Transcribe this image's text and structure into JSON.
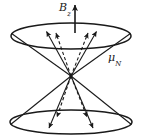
{
  "figure": {
    "type": "double-cone-precession-diagram",
    "background_color": "#ffffff",
    "stroke_color": "#1a1a1a",
    "labels": {
      "field": {
        "symbol": "B",
        "subscript": "z",
        "full": "Bz"
      },
      "moment": {
        "symbol": "μ",
        "subscript": "N",
        "full": "μN"
      }
    },
    "geometry": {
      "apex": {
        "x": 71,
        "y": 76
      },
      "top_ellipse": {
        "cx": 71,
        "cy": 36,
        "rx": 60,
        "ry": 13
      },
      "bottom_ellipse": {
        "cx": 71,
        "cy": 122,
        "rx": 61,
        "ry": 12
      },
      "field_arrow": {
        "x": 75,
        "y_start": 33,
        "y_end": 4
      }
    }
  }
}
